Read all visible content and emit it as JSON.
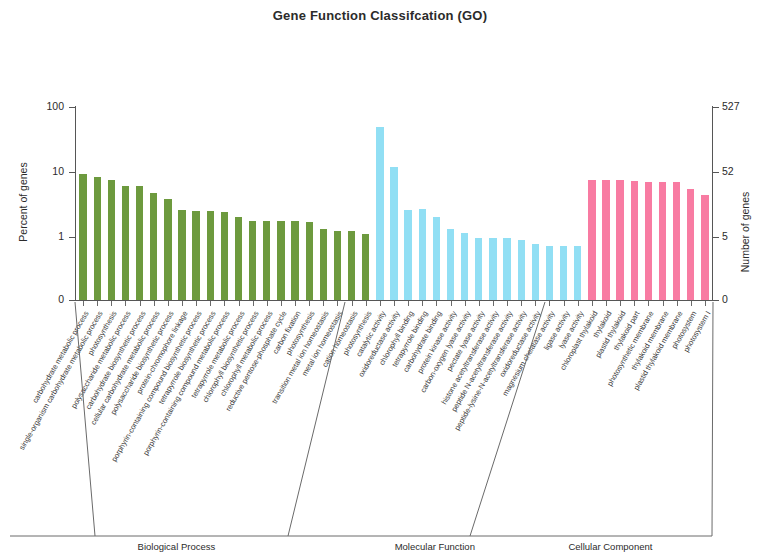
{
  "title": "Gene Function Classifcation (GO)",
  "axes": {
    "left_title": "Percent of genes",
    "right_title": "Number of genes",
    "left_ticks": [
      "100",
      "10",
      "1",
      "0"
    ],
    "right_ticks": [
      "527",
      "52",
      "5",
      "0"
    ]
  },
  "colors": {
    "biological_process": "#6d9a3e",
    "molecular_function": "#91dff4",
    "cellular_component": "#f87ba2",
    "axis": "#565656"
  },
  "groups": [
    {
      "id": "bp",
      "label": "Biological Process"
    },
    {
      "id": "mf",
      "label": "Molecular Function"
    },
    {
      "id": "cc",
      "label": "Cellular Component"
    }
  ],
  "chart_data": {
    "type": "bar",
    "title": "Gene Function Classifcation (GO)",
    "xlabel": "",
    "ylabel": "Percent of genes",
    "y2label": "Number of genes",
    "yscale": "log",
    "ylim": [
      0.35,
      100
    ],
    "y_ticks": [
      1,
      10,
      100
    ],
    "y2_ticks": [
      5,
      52,
      527
    ],
    "grid": false,
    "legend": "none",
    "series": [
      {
        "name": "Biological Process",
        "color": "#6d9a3e",
        "categories": [
          "carbohydrate metabolic process",
          "single-organism carbohydrate metabolic process",
          "photosynthesis",
          "polysaccharide metabolic process",
          "carbohydrate biosynthetic process",
          "cellular carbohydrate metabolic process",
          "polysaccharide biosynthetic process",
          "protein-chromophore linkage",
          "porphyrin-containing compound biosynthetic process",
          "tetrapyrrole biosynthetic process",
          "porphyrin-containing compound metabolic process",
          "tetrapyrrole metabolic process",
          "chlorophyll biosynthetic process",
          "chlorophyll metabolic process",
          "reductive pentose-phosphate cycle",
          "carbon fixation",
          "photosynthesis",
          "transition metal ion homeostasis",
          "metal ion homeostasis",
          "cation homeostasis",
          "photosynthesis"
        ],
        "values": [
          9.3,
          8.3,
          7.6,
          6.2,
          6.1,
          4.8,
          3.9,
          2.6,
          2.5,
          2.5,
          2.4,
          2.0,
          1.75,
          1.75,
          1.75,
          1.75,
          1.7,
          1.35,
          1.25,
          1.25,
          1.1
        ]
      },
      {
        "name": "Molecular Function",
        "color": "#91dff4",
        "categories": [
          "catalytic activity",
          "oxidoreductase activity",
          "chlorophyll binding",
          "tetrapyrrole binding",
          "carbohydrate binding",
          "protein kinase activity",
          "carbon-oxygen lyase activity",
          "pectate lyase activity",
          "histone acetyltransferase activity",
          "peptide N-acetyltransferase activity",
          "peptide-lysine-N-acetyltransferase activity",
          "oxidoreductase activity",
          "magnesium chelatase activity",
          "ligase activity",
          "lyase activity"
        ],
        "values": [
          50.0,
          12.0,
          2.6,
          2.7,
          2.0,
          1.35,
          1.15,
          0.95,
          0.95,
          0.95,
          0.9,
          0.78,
          0.72,
          0.72,
          0.72
        ]
      },
      {
        "name": "Cellular Component",
        "color": "#f87ba2",
        "categories": [
          "chloroplast thylakoid",
          "thylakoid",
          "plastid thylakoid",
          "thylakoid part",
          "photosynthetic membrane",
          "thylakoid membrane",
          "plastid thylakoid membrane",
          "photosystem",
          "photosystem I"
        ],
        "values": [
          7.5,
          7.5,
          7.5,
          7.4,
          7.0,
          6.9,
          6.9,
          5.5,
          4.4
        ]
      }
    ]
  }
}
